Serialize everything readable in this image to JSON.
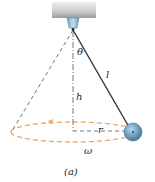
{
  "figure": {
    "caption": "(a)",
    "labels": {
      "theta": "θ",
      "length": "l",
      "height": "h",
      "radius": "r",
      "omega": "ω"
    },
    "colors": {
      "ceiling_top": "#e4e5e3",
      "ceiling_bottom": "#9fa3a0",
      "mount": "#8cb8d4",
      "string": "#333333",
      "bob": "#5e93b5",
      "bob_highlight": "#a9cde3",
      "orbit": "#e8a86a",
      "axis": "#555555"
    }
  }
}
